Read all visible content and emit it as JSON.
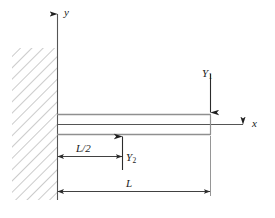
{
  "diagram": {
    "type": "cantilever-beam-free-body-diagram",
    "axes": {
      "y_label": "y",
      "x_label": "x"
    },
    "forces": [
      {
        "id": "Y1",
        "symbol": "Y",
        "subscript": "1",
        "direction": "down",
        "location": "free-end"
      },
      {
        "id": "Y2",
        "symbol": "Y",
        "subscript": "2",
        "direction": "up",
        "location": "midspan"
      }
    ],
    "dimensions": [
      {
        "id": "half-length",
        "label": "L/2"
      },
      {
        "id": "full-length",
        "label": "L"
      }
    ],
    "support": {
      "kind": "fixed-wall",
      "hatching": "diagonal"
    },
    "colors": {
      "line": "#3a3a3a",
      "beam_outline": "#9a9a9a",
      "hatch": "#9a9a9a",
      "background": "#ffffff"
    }
  }
}
